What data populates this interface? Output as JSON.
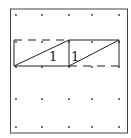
{
  "diagram": {
    "type": "dot-grid-geoboard",
    "grid": {
      "columns_x": [
        16,
        42,
        69,
        92,
        119
      ],
      "rows_y": [
        15,
        42,
        67,
        99,
        127
      ],
      "dot_color": "#333333"
    },
    "frame": {
      "x": 10,
      "y": 9,
      "width": 118,
      "height": 124,
      "stroke": "#444444"
    },
    "shapes": [
      {
        "name": "left-rectangle",
        "label": "1",
        "x1": 14,
        "y1": 40,
        "x2": 69,
        "y2": 66,
        "solid_edges": [
          "left",
          "bottom"
        ],
        "dashed_edges": [
          "top"
        ],
        "diagonal": "bottom-left-to-top-right"
      },
      {
        "name": "right-rectangle",
        "label": "1",
        "x1": 69,
        "y1": 40,
        "x2": 119,
        "y2": 66,
        "solid_edges": [
          "left",
          "top",
          "right"
        ],
        "dashed_edges": [
          "bottom"
        ],
        "diagonal": "bottom-left-to-top-right"
      }
    ],
    "labels": {
      "left": "1",
      "right": "1"
    }
  }
}
